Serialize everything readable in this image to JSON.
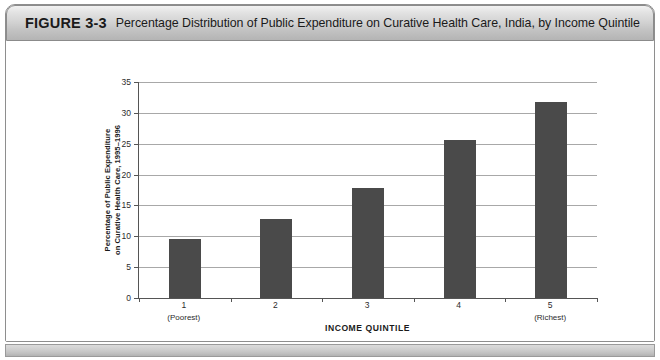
{
  "figure": {
    "number": "FIGURE 3-3",
    "title": "Percentage Distribution of Public Expenditure on Curative Health Care, India, by Income Quintile"
  },
  "chart_data": {
    "type": "bar",
    "title": "Percentage Distribution of Public Expenditure on Curative Health Care, India, by Income Quintile",
    "categories": [
      "1",
      "2",
      "3",
      "4",
      "5"
    ],
    "category_sublabels": [
      "(Poorest)",
      "",
      "",
      "",
      "(Richest)"
    ],
    "values": [
      9.6,
      12.8,
      17.8,
      25.6,
      31.8
    ],
    "xlabel": "INCOME QUINTILE",
    "ylabel_line1": "Percentage of Public Expenditure",
    "ylabel_line2": "on Curative Health Care, 1995–1996",
    "ylim": [
      0,
      35
    ],
    "ytick_values": [
      0,
      5,
      10,
      15,
      20,
      25,
      30,
      35
    ],
    "ytick_labels": [
      "0",
      "5",
      "10",
      "15",
      "20",
      "25",
      "30",
      "35"
    ],
    "grid": true,
    "legend": "none",
    "bar_color": "#4a4a4a",
    "gridline_color": "#a8a8a8",
    "axis_color": "#555555"
  }
}
